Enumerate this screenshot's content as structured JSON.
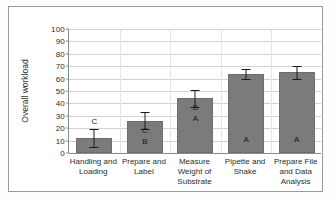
{
  "chart_data": {
    "type": "bar",
    "title": "",
    "xlabel": "",
    "ylabel": "Overall workload",
    "ylim": [
      0,
      100
    ],
    "ytick_step": 10,
    "yticks": [
      0,
      10,
      20,
      30,
      40,
      50,
      60,
      70,
      80,
      90,
      100
    ],
    "grid": true,
    "legend": "none",
    "bar_color": "#7b7b7b",
    "error_bar_color": "#1a1a1a",
    "categories": [
      "Handling and Loading",
      "Prepare and Label",
      "Measure Weight of Substrate",
      "Pipette and Shake",
      "Prepare File and Data Analysis"
    ],
    "category_lines": [
      [
        "Handling and",
        "Loading"
      ],
      [
        "Prepare and",
        "Label"
      ],
      [
        "Measure",
        "Weight of",
        "Substrate"
      ],
      [
        "Pipette and",
        "Shake"
      ],
      [
        "Prepare File",
        "and Data",
        "Analysis"
      ]
    ],
    "values": [
      12,
      26,
      44,
      64,
      65
    ],
    "errors": [
      7,
      7,
      7,
      4,
      5
    ],
    "group_letters": [
      [
        "C"
      ],
      [
        "C",
        "B"
      ],
      [
        "B",
        "A"
      ],
      [
        "A"
      ],
      [
        "A"
      ]
    ],
    "series": [
      {
        "name": "Overall workload",
        "values": [
          12,
          26,
          44,
          64,
          65
        ],
        "errors": [
          7,
          7,
          7,
          4,
          5
        ]
      }
    ]
  }
}
